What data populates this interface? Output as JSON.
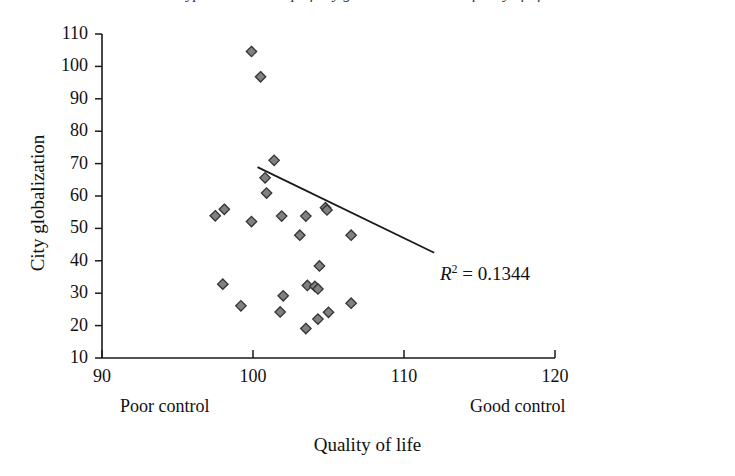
{
  "figure": {
    "cropped_caption_fragment": "ypical relationship of city globalization versus quality of life",
    "background": "#ffffff",
    "ink_color": "#1a1a1a",
    "marker_fill": "#808080",
    "marker_edge": "#333333"
  },
  "axis_annotations": {
    "x_low_label": "Poor control",
    "x_high_label": "Good control"
  },
  "annotation": {
    "r_symbol": "R",
    "r_exponent": "2",
    "r_equals": " = 0.1344",
    "r2_value": 0.1344,
    "full_text": "R2 = 0.1344"
  },
  "chart_data": {
    "type": "scatter",
    "title": "",
    "xlabel": "Quality of life",
    "ylabel": "City globalization",
    "xlim": [
      90,
      120
    ],
    "ylim": [
      10,
      110
    ],
    "xticks": [
      90,
      100,
      110,
      120
    ],
    "yticks": [
      10,
      20,
      30,
      40,
      50,
      60,
      70,
      80,
      90,
      100,
      110
    ],
    "grid": false,
    "legend": null,
    "marker": "diamond",
    "points": [
      {
        "x": 99.9,
        "y": 104.6
      },
      {
        "x": 100.5,
        "y": 96.8
      },
      {
        "x": 101.4,
        "y": 71.0
      },
      {
        "x": 100.8,
        "y": 65.6
      },
      {
        "x": 100.9,
        "y": 60.9
      },
      {
        "x": 97.5,
        "y": 53.9
      },
      {
        "x": 98.1,
        "y": 55.9
      },
      {
        "x": 99.9,
        "y": 52.1
      },
      {
        "x": 101.9,
        "y": 53.8
      },
      {
        "x": 103.5,
        "y": 53.8
      },
      {
        "x": 104.8,
        "y": 56.4
      },
      {
        "x": 104.9,
        "y": 55.7
      },
      {
        "x": 103.1,
        "y": 47.9
      },
      {
        "x": 106.5,
        "y": 47.9
      },
      {
        "x": 104.4,
        "y": 38.4
      },
      {
        "x": 98.0,
        "y": 32.8
      },
      {
        "x": 103.6,
        "y": 32.4
      },
      {
        "x": 104.1,
        "y": 32.1
      },
      {
        "x": 104.3,
        "y": 31.3
      },
      {
        "x": 102.0,
        "y": 29.2
      },
      {
        "x": 99.2,
        "y": 26.1
      },
      {
        "x": 106.5,
        "y": 26.9
      },
      {
        "x": 101.8,
        "y": 24.2
      },
      {
        "x": 105.0,
        "y": 24.1
      },
      {
        "x": 104.3,
        "y": 22.0
      },
      {
        "x": 103.5,
        "y": 19.1
      }
    ],
    "trendline": {
      "type": "linear",
      "x_start": 100.3,
      "y_start": 68.9,
      "x_end": 112.0,
      "y_end": 42.5,
      "r_squared": 0.1344
    }
  }
}
